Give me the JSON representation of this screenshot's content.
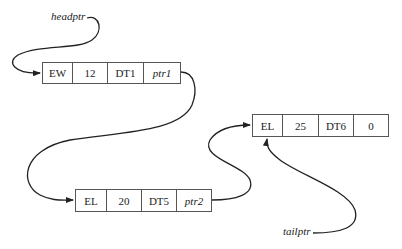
{
  "diagram": {
    "type": "linked-list",
    "labels": {
      "head": "headptr",
      "tail": "tailptr"
    },
    "nodes": [
      {
        "id": "node1",
        "cells": [
          "EW",
          "12",
          "DT1",
          "ptr1"
        ],
        "pointer_cell_index": 3
      },
      {
        "id": "node2",
        "cells": [
          "EL",
          "20",
          "DT5",
          "ptr2"
        ],
        "pointer_cell_index": 3
      },
      {
        "id": "node3",
        "cells": [
          "EL",
          "25",
          "DT6",
          "0"
        ],
        "pointer_cell_index": null
      }
    ],
    "edges": [
      {
        "from": "headptr",
        "to": "node1"
      },
      {
        "from": "node1",
        "to": "node2"
      },
      {
        "from": "node2",
        "to": "node3"
      },
      {
        "from": "tailptr",
        "to": "node3"
      }
    ],
    "colors": {
      "line": "#222222",
      "box_border": "#555555"
    }
  }
}
